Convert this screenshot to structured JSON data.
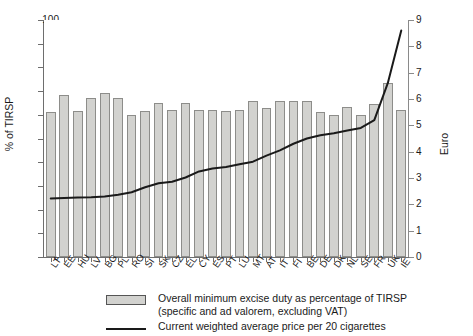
{
  "chart_data": {
    "type": "bar",
    "title": "",
    "subtitle": "",
    "xlabel": "",
    "ylabel": "% of TIRSP",
    "ylabel_secondary": "Euro",
    "ylim": [
      0,
      100
    ],
    "ylim_secondary": [
      0,
      9
    ],
    "yticks": [
      0,
      10,
      20,
      30,
      40,
      50,
      60,
      70,
      80,
      90,
      100
    ],
    "yticks_secondary": [
      0,
      1,
      2,
      3,
      4,
      5,
      6,
      7,
      8,
      9
    ],
    "grid": false,
    "legend_position": "bottom",
    "categories": [
      "LT",
      "EE",
      "HU",
      "LV",
      "BG",
      "PL",
      "RO",
      "SI",
      "SK",
      "CZ",
      "EL",
      "CY",
      "ES",
      "PT",
      "LU",
      "MT",
      "AT",
      "IT",
      "FI",
      "BE",
      "DE",
      "DK",
      "NL",
      "SE",
      "FR",
      "UK",
      "IE"
    ],
    "series": [
      {
        "name": "Overall minimum excise duty as percentage of TIRSP (specific and ad valorem, excluding VAT)",
        "type": "bar",
        "axis": "left",
        "unit": "% of TIRSP",
        "color": "#d2d2cf",
        "values": [
          61.0,
          68.5,
          61.5,
          67.0,
          69.0,
          67.0,
          60.0,
          61.5,
          65.0,
          62.0,
          65.0,
          62.0,
          62.0,
          61.5,
          62.0,
          66.0,
          63.0,
          66.0,
          66.0,
          66.0,
          61.0,
          60.0,
          63.5,
          60.0,
          64.5,
          73.5,
          62.0
        ]
      },
      {
        "name": "Current weighted average price per 20 cigarettes",
        "type": "line",
        "axis": "right",
        "unit": "Euro",
        "color": "#1a1a1a",
        "values": [
          2.22,
          2.24,
          2.26,
          2.27,
          2.3,
          2.36,
          2.46,
          2.65,
          2.8,
          2.86,
          3.02,
          3.25,
          3.36,
          3.42,
          3.52,
          3.62,
          3.85,
          4.05,
          4.3,
          4.5,
          4.62,
          4.7,
          4.8,
          4.9,
          5.2,
          6.6,
          8.6
        ]
      }
    ]
  },
  "legend": {
    "bar_line1": "Overall minimum excise duty as percentage of TIRSP",
    "bar_line2": "(specific and ad valorem, excluding VAT)",
    "line_label": "Current weighted average price per 20 cigarettes"
  }
}
